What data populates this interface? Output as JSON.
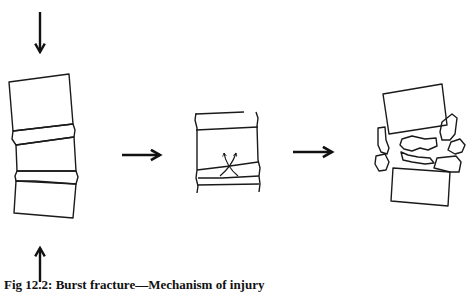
{
  "figure": {
    "caption": "Fig 12.2: Burst fracture—Mechanism of injury",
    "caption_clipped": true
  },
  "diagram": {
    "stages": [
      {
        "id": "axial-load",
        "label": "",
        "description": "Stack of two vertebral bodies with intervertebral discs under axial compression (arrows above and below)"
      },
      {
        "id": "disc-herniation",
        "label": "",
        "description": "Vertebral body with crossed curved arrows showing the nucleus of the disc being forced into the body"
      },
      {
        "id": "burst-fracture",
        "label": "",
        "description": "Vertebral body shattered into fragments displaced outward between the intact adjacent vertebrae"
      }
    ],
    "arrows": [
      {
        "id": "compression-top",
        "direction": "down"
      },
      {
        "id": "compression-bottom",
        "direction": "up"
      },
      {
        "id": "progression-1",
        "direction": "right"
      },
      {
        "id": "progression-2",
        "direction": "right"
      }
    ],
    "stroke_color": "#1a1a1a",
    "background": "#ffffff"
  }
}
